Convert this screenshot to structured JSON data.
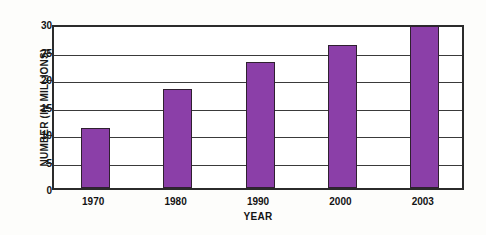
{
  "chart_data": {
    "type": "bar",
    "title": "",
    "xlabel": "YEAR",
    "ylabel": "NUMBER (IN MILLIONS)",
    "categories": [
      "1970",
      "1980",
      "1990",
      "2000",
      "2003"
    ],
    "values": [
      11,
      18,
      23,
      26,
      29.5
    ],
    "series": [
      {
        "name": "Number (in millions)",
        "values": [
          11,
          18,
          23,
          26,
          29.5
        ]
      }
    ],
    "ylim": [
      0,
      30
    ],
    "yticks": [
      0,
      5,
      10,
      15,
      20,
      25,
      30
    ],
    "ytick_labels": [
      "0",
      "5",
      "10",
      "15",
      "20",
      "25",
      "30"
    ],
    "grid": true,
    "grid_axis": "y",
    "legend": false,
    "legend_position": "none",
    "bar_color": "#8b3fa8",
    "bar_edge_color": "#2f2030",
    "axis_color": "#2b2b2b",
    "plot_background": "#ffffff",
    "figure_background": "#fdfdfb"
  }
}
